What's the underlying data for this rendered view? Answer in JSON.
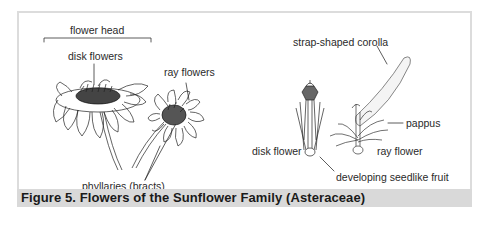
{
  "figure": {
    "caption": "Figure 5. Flowers of the Sunflower Family (Asteraceae)",
    "caption_bar_color": "#d9d9d9",
    "frame_color": "#dcdcdc"
  },
  "labels": {
    "flower_head": "flower head",
    "disk_flowers": "disk flowers",
    "ray_flowers": "ray flowers",
    "phyllaries": "phyllaries (bracts)",
    "strap_corolla": "strap-shaped corolla",
    "pappus": "pappus",
    "disk_flower": "disk flower",
    "ray_flower": "ray flower",
    "seedlike_fruit": "developing seedlike fruit"
  }
}
